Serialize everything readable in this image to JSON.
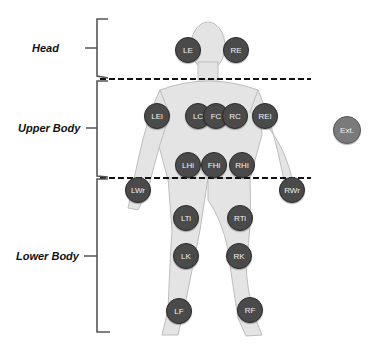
{
  "regions": [
    {
      "label": "Head"
    },
    {
      "label": "Upper Body"
    },
    {
      "label": "Lower Body"
    }
  ],
  "nodes": {
    "LE": "LE",
    "RE": "RE",
    "LEl": "LEl",
    "LC": "LC",
    "FC": "FC",
    "RC": "RC",
    "REl": "REl",
    "LHi": "LHi",
    "FHi": "FHi",
    "RHi": "RHi",
    "LWr": "LWr",
    "RWr": "RWr",
    "LTi": "LTi",
    "RTi": "RTi",
    "LK": "LK",
    "RK": "RK",
    "LF": "LF",
    "RF": "RF",
    "Ext": "Ext."
  },
  "colors": {
    "node_fill": "#4a4a4a",
    "ext_fill": "#7a7a7a",
    "divider": "#111111",
    "body": "#e6e6e6"
  }
}
